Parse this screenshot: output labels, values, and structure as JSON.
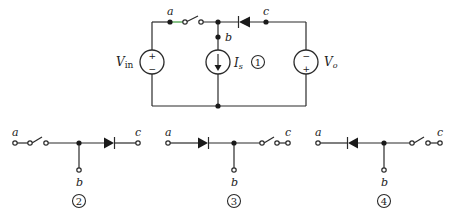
{
  "main_circuit": {
    "label_number": "1",
    "nodes": {
      "a": "a",
      "b": "b",
      "c": "c"
    },
    "sources": {
      "vin": {
        "label": "V",
        "subscript": "in",
        "top_sign": "+",
        "bottom_sign": "−"
      },
      "is": {
        "label": "I",
        "subscript": "s"
      },
      "vo": {
        "label": "V",
        "subscript": "o",
        "top_sign": "−",
        "bottom_sign": "+"
      }
    }
  },
  "sub_circuits": [
    {
      "number": "2",
      "a": "a",
      "b": "b",
      "c": "c",
      "diode_direction": "right",
      "switch_side": "a"
    },
    {
      "number": "3",
      "a": "a",
      "b": "b",
      "c": "c",
      "diode_direction": "right",
      "switch_side": "c"
    },
    {
      "number": "4",
      "a": "a",
      "b": "b",
      "c": "c",
      "diode_direction": "left",
      "switch_side": "c"
    }
  ],
  "colors": {
    "ink": "#2a2a2a",
    "background": "#ffffff"
  }
}
